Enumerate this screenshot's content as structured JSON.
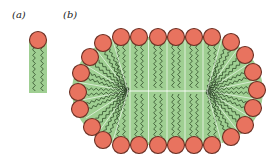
{
  "panels": [
    {
      "id": "a",
      "label": "(a)",
      "description": "single lipid molecule: polar head with two hydrocarbon tails"
    },
    {
      "id": "b",
      "label": "(b)",
      "description": "lipid bilayer disc / micelle cross-section"
    }
  ],
  "colors": {
    "head_fill": "#e8735f",
    "head_stroke": "#6b3024",
    "tail_region": "#9fcf92",
    "tail_line": "#1f3a1a",
    "divider": "#ffffff"
  },
  "panel_b": {
    "left_focus": [
      128,
      91
    ],
    "right_focus": [
      207,
      91
    ],
    "head_radius": 8.5,
    "top_heads_x": [
      121,
      139,
      158,
      176,
      194,
      212
    ],
    "bottom_heads_x": [
      121,
      139,
      158,
      176,
      194,
      212
    ]
  }
}
